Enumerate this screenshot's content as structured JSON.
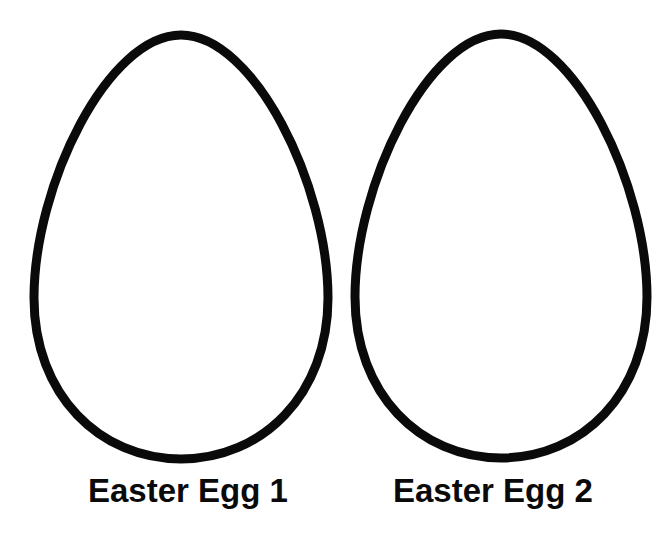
{
  "page": {
    "background_color": "#ffffff",
    "ink_color": "#0a0a0a"
  },
  "eggs": [
    {
      "label": "Easter Egg 1",
      "shape": "egg-outline"
    },
    {
      "label": "Easter Egg 2",
      "shape": "egg-outline"
    }
  ]
}
